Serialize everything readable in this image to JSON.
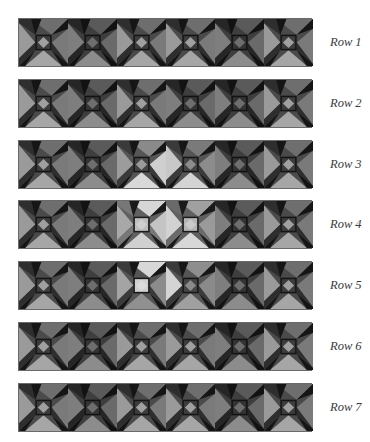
{
  "rows": [
    {
      "label": "Row 1",
      "top": 18,
      "blocks": [
        "n",
        "d",
        "n",
        "n",
        "d",
        "n"
      ]
    },
    {
      "label": "Row 2",
      "top": 79,
      "blocks": [
        "n",
        "d",
        "n",
        "d",
        "d",
        "n"
      ]
    },
    {
      "label": "Row 3",
      "top": 140,
      "blocks": [
        "n",
        "d",
        "lr",
        "ll",
        "d",
        "n"
      ]
    },
    {
      "label": "Row 4",
      "top": 200,
      "blocks": [
        "n",
        "d",
        "xl",
        "xr",
        "d",
        "n"
      ]
    },
    {
      "label": "Row 5",
      "top": 261,
      "blocks": [
        "n",
        "d",
        "lu",
        "lv",
        "d",
        "n"
      ]
    },
    {
      "label": "Row 6",
      "top": 322,
      "blocks": [
        "n",
        "d",
        "n",
        "n",
        "d",
        "n"
      ]
    },
    {
      "label": "Row 7",
      "top": 383,
      "blocks": [
        "n",
        "d",
        "n",
        "n",
        "d",
        "n"
      ]
    }
  ],
  "palettes": {
    "n": {
      "bg": "#4a4a4a",
      "left": "#9a9a9a",
      "top": "#6e6e6e",
      "right": "#7a7a7a",
      "bottom": "#a6a6a6",
      "blade": "#151515",
      "blade2": "#2e2e2e",
      "center": "#3c3c3c",
      "diamond": "#a0a0a0"
    },
    "d": {
      "bg": "#3e3e3e",
      "left": "#7e7e7e",
      "top": "#5a5a5a",
      "right": "#6a6a6a",
      "bottom": "#8c8c8c",
      "blade": "#121212",
      "blade2": "#262626",
      "center": "#333333",
      "diamond": "#6e6e6e"
    },
    "lr": {
      "bg": "#555555",
      "left": "#9c9c9c",
      "top": "#8a8a8a",
      "right": "#cfcfcf",
      "bottom": "#d8d8d8",
      "blade": "#161616",
      "blade2": "#3a3a3a",
      "center": "#444444",
      "diamond": "#9a9a9a"
    },
    "ll": {
      "bg": "#555555",
      "left": "#c8c8c8",
      "top": "#7a7a7a",
      "right": "#8c8c8c",
      "bottom": "#d4d4d4",
      "blade": "#161616",
      "blade2": "#3a3a3a",
      "center": "#444444",
      "diamond": "#8c8c8c"
    },
    "xl": {
      "bg": "#606060",
      "left": "#a8a8a8",
      "top": "#d6d6d6",
      "right": "#c4c4c4",
      "bottom": "#d0d0d0",
      "blade": "#1a1a1a",
      "blade2": "#777777",
      "center": "#bdbdbd",
      "diamond": "#cfcfcf"
    },
    "xr": {
      "bg": "#606060",
      "left": "#d2d2d2",
      "top": "#a0a0a0",
      "right": "#9a9a9a",
      "bottom": "#d8d8d8",
      "blade": "#1a1a1a",
      "blade2": "#6a6a6a",
      "center": "#b5b5b5",
      "diamond": "#cacaca"
    },
    "lu": {
      "bg": "#555555",
      "left": "#a4a4a4",
      "top": "#d8d8d8",
      "right": "#8c8c8c",
      "bottom": "#909090",
      "blade": "#161616",
      "blade2": "#3a3a3a",
      "center": "#cfcfcf",
      "diamond": "#dadada"
    },
    "lv": {
      "bg": "#555555",
      "left": "#d4d4d4",
      "top": "#8e8e8e",
      "right": "#8a8a8a",
      "bottom": "#a0a0a0",
      "blade": "#161616",
      "blade2": "#3a3a3a",
      "center": "#444444",
      "diamond": "#8a8a8a"
    }
  }
}
